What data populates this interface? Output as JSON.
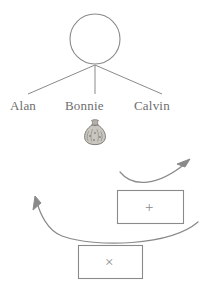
{
  "diagram": {
    "stroke_color": "#8a8a8a",
    "text_color": "#6e6e6e",
    "background_color": "#ffffff",
    "node": {
      "shape": "circle",
      "name": "root-circle",
      "label": "",
      "center_x": 95,
      "center_y": 39,
      "radius": 25
    },
    "branches": [
      {
        "from_x": 95,
        "from_y": 65,
        "to_x": 28,
        "to_y": 94
      },
      {
        "from_x": 95,
        "from_y": 65,
        "to_x": 95,
        "to_y": 94
      },
      {
        "from_x": 95,
        "from_y": 65,
        "to_x": 162,
        "to_y": 94
      }
    ],
    "names": [
      {
        "key": "alan",
        "label": "Alan"
      },
      {
        "key": "bonnie",
        "label": "Bonnie"
      },
      {
        "key": "calvin",
        "label": "Calvin"
      }
    ],
    "money_bag": {
      "icon": "money-bag-icon",
      "glyph": "money-bag",
      "owner": "Bonnie",
      "x": 80,
      "y": 117,
      "width": 30,
      "height": 30
    },
    "boxes": [
      {
        "key": "plus",
        "operation": "+",
        "icon": "plus-icon",
        "x": 117,
        "y": 190,
        "width": 66,
        "height": 33
      },
      {
        "key": "times",
        "operation": "×",
        "icon": "multiply-icon",
        "x": 78,
        "y": 245,
        "width": 64,
        "height": 33
      }
    ],
    "arrows": [
      {
        "key": "arrow-up-right",
        "direction": "up-right",
        "description": "curved arrow sweeping from left over the plus box toward the upper right",
        "start_x": 120,
        "start_y": 172,
        "end_x": 189,
        "end_y": 161
      },
      {
        "key": "arrow-up-left",
        "direction": "up-left",
        "description": "curved arrow sweeping from the right under the plus box toward the upper left",
        "start_x": 196,
        "start_y": 221,
        "end_x": 36,
        "end_y": 198
      }
    ]
  }
}
